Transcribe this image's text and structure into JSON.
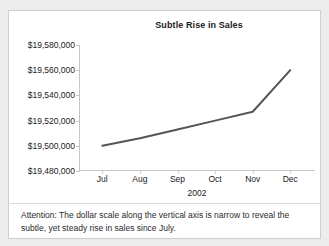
{
  "chart_data": {
    "type": "line",
    "title": "Subtle Rise in Sales",
    "xlabel": "2002",
    "ylabel": "",
    "categories": [
      "Jul",
      "Aug",
      "Sep",
      "Oct",
      "Nov",
      "Dec"
    ],
    "values": [
      19500000,
      19506000,
      19513000,
      19520000,
      19527000,
      19560000
    ],
    "series": [
      {
        "name": "Sales",
        "values": [
          19500000,
          19506000,
          19513000,
          19520000,
          19527000,
          19560000
        ]
      }
    ],
    "ylim": [
      19480000,
      19580000
    ],
    "ytick_values": [
      19480000,
      19500000,
      19520000,
      19540000,
      19560000,
      19580000
    ],
    "ytick_labels": [
      "$19,480,000",
      "$19,500,000",
      "$19,520,000",
      "$19,540,000",
      "$19,560,000",
      "$19,580,000"
    ],
    "grid": false,
    "legend": false,
    "line_color": "#555555",
    "axis_color": "#c6c6c6"
  },
  "caption": {
    "text": "Attention: The dollar scale along the vertical axis is narrow to reveal the subtle, yet steady rise in sales since July."
  }
}
